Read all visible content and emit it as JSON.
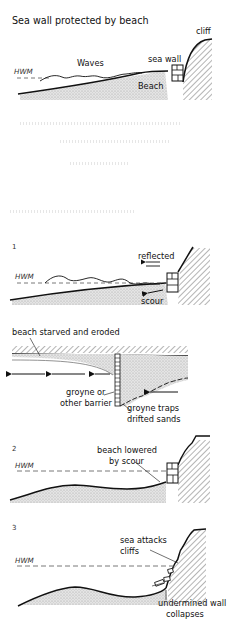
{
  "figure": {
    "title": "Sea wall protected by beach",
    "panel0": {
      "hwm": "HWM",
      "waves": "Waves",
      "sea_wall": "sea wall",
      "beach": "Beach",
      "cliff": "cliff"
    },
    "panel1": {
      "number": "1",
      "hwm": "HWM",
      "reflected": "reflected",
      "scour": "scour"
    },
    "plan": {
      "starved": "beach starved and eroded",
      "groyne_line1": "groyne or",
      "groyne_line2": "other barrier",
      "traps_line1": "groyne traps",
      "traps_line2": "drifted sands"
    },
    "panel2": {
      "number": "2",
      "hwm": "HWM",
      "lowered_line1": "beach lowered",
      "lowered_line2": "by scour"
    },
    "panel3": {
      "number": "3",
      "hwm": "HWM",
      "attacks_line1": "sea attacks",
      "attacks_line2": "cliffs",
      "collapse_line1": "undermined wall",
      "collapse_line2": "collapses"
    }
  },
  "colors": {
    "ink": "#111111",
    "sand": "#d9d9d9",
    "paper": "#ffffff"
  }
}
